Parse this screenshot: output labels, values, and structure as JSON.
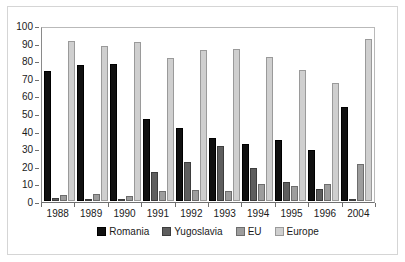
{
  "chart_data": {
    "type": "bar",
    "title": "",
    "subtitle": "",
    "xlabel": "",
    "ylabel": "",
    "ylim": [
      0,
      100
    ],
    "yticks": [
      0,
      10,
      20,
      30,
      40,
      50,
      60,
      70,
      80,
      90,
      100
    ],
    "grid": false,
    "legend_position": "bottom",
    "categories": [
      "1988",
      "1989",
      "1990",
      "1991",
      "1992",
      "1993",
      "1994",
      "1995",
      "1996",
      "2004"
    ],
    "series": [
      {
        "name": "Romania",
        "color": "#101010",
        "values": [
          75,
          78,
          79,
          47,
          42,
          36.5,
          33,
          35,
          29.5,
          54
        ]
      },
      {
        "name": "Yugoslavia",
        "color": "#5e5e5e",
        "values": [
          2,
          1,
          1,
          16.5,
          22.5,
          31.5,
          19,
          11,
          7,
          1
        ]
      },
      {
        "name": "EU",
        "color": "#9d9d9d",
        "values": [
          3.5,
          4,
          3,
          5.5,
          6.5,
          5.5,
          10,
          8.5,
          9.5,
          21
        ]
      },
      {
        "name": "Europe",
        "color": "#cfcfcf",
        "values": [
          92,
          89,
          91.5,
          82,
          87,
          87.5,
          82.5,
          75.5,
          68,
          93
        ]
      }
    ]
  }
}
